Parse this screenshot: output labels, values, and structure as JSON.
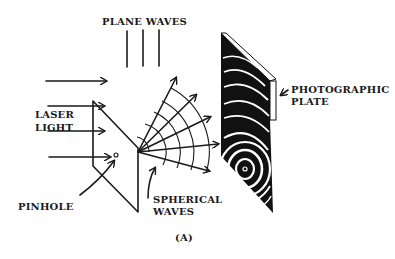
{
  "figure": {
    "caption": "(A)",
    "labels": {
      "plane_waves": "PLANE WAVES",
      "laser_line1": "LASER",
      "laser_line2": "LIGHT",
      "pinhole": "PINHOLE",
      "spherical_line1": "SPHERICAL",
      "spherical_line2": "WAVES",
      "plate_line1": "PHOTOGRAPHIC",
      "plate_line2": "PLATE"
    },
    "components": [
      "plane-waves",
      "laser-light-arrows",
      "pinhole-screen",
      "spherical-waves",
      "photographic-plate"
    ],
    "colors": {
      "ink": "#1a1a1a",
      "background": "#ffffff"
    }
  }
}
